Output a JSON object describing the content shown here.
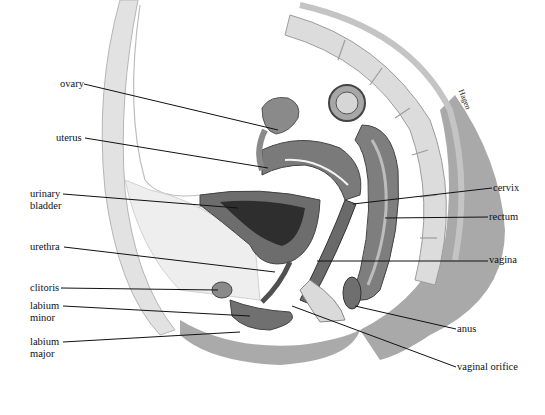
{
  "diagram": {
    "signature": "Hagen",
    "labels_left": [
      {
        "id": "ovary",
        "text": "ovary",
        "x": 60,
        "y": 78,
        "line": [
          84,
          84,
          278,
          130
        ]
      },
      {
        "id": "uterus",
        "text": "uterus",
        "x": 56,
        "y": 132,
        "line": [
          85,
          138,
          268,
          168
        ]
      },
      {
        "id": "urinary-bladder",
        "line1": "urinary",
        "line2": "bladder",
        "x": 30,
        "y": 188,
        "line": [
          63,
          194,
          238,
          208
        ]
      },
      {
        "id": "urethra",
        "text": "urethra",
        "x": 30,
        "y": 241,
        "line": [
          64,
          247,
          275,
          272
        ]
      },
      {
        "id": "clitoris",
        "text": "clitoris",
        "x": 30,
        "y": 282,
        "line": [
          61,
          288,
          218,
          290
        ]
      },
      {
        "id": "labium-minor",
        "line1": "labium",
        "line2": "minor",
        "x": 30,
        "y": 302,
        "line": [
          63,
          306,
          250,
          316
        ]
      },
      {
        "id": "labium-major",
        "line1": "labium",
        "line2": "major",
        "x": 30,
        "y": 338,
        "line": [
          63,
          342,
          240,
          332
        ]
      }
    ],
    "labels_right": [
      {
        "id": "cervix",
        "text": "cervix",
        "x": 493,
        "y": 182,
        "line": [
          492,
          188,
          353,
          204
        ]
      },
      {
        "id": "rectum",
        "text": "rectum",
        "x": 489,
        "y": 211,
        "line": [
          488,
          217,
          385,
          218
        ]
      },
      {
        "id": "vagina",
        "text": "vagina",
        "x": 489,
        "y": 254,
        "line": [
          488,
          261,
          317,
          261
        ]
      },
      {
        "id": "anus",
        "text": "anus",
        "x": 457,
        "y": 323,
        "line": [
          456,
          329,
          355,
          306
        ]
      },
      {
        "id": "vaginal-orifice",
        "text": "vaginal orifice",
        "x": 457,
        "y": 361,
        "line": [
          456,
          367,
          292,
          306
        ]
      }
    ],
    "colors": {
      "background": "#ffffff",
      "ink": "#111111",
      "dark_tissue": "#5a5a5a",
      "mid_tissue": "#8c8c8c",
      "light_tissue": "#cfcfcf",
      "fat": "#ececec",
      "skin_shadow": "#9a9a9a"
    }
  }
}
